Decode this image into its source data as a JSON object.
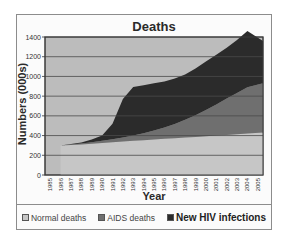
{
  "chart_data": {
    "type": "area",
    "stacked": true,
    "title": "Deaths",
    "xlabel": "Year",
    "ylabel": "Numbers (000s)",
    "ylim": [
      0,
      1400
    ],
    "yticks": [
      0,
      200,
      400,
      600,
      800,
      1000,
      1200,
      1400
    ],
    "grid": true,
    "legend_position": "bottom",
    "categories": [
      "1985",
      "1986",
      "1987",
      "1988",
      "1989",
      "1990",
      "1991",
      "1992",
      "1993",
      "1994",
      "1995",
      "1996",
      "1997",
      "1998",
      "1999",
      "2000",
      "2001",
      "2002",
      "2003",
      "2004",
      "2005"
    ],
    "series": [
      {
        "name": "Normal deaths",
        "color": "#c6c6c6",
        "values": [
          0,
          300,
          305,
          310,
          318,
          325,
          333,
          340,
          347,
          353,
          360,
          367,
          373,
          380,
          387,
          393,
          400,
          407,
          413,
          420,
          430
        ]
      },
      {
        "name": "AIDS deaths",
        "color": "#6f6f6f",
        "values": [
          0,
          0,
          5,
          10,
          15,
          22,
          30,
          40,
          55,
          70,
          90,
          115,
          145,
          180,
          220,
          265,
          315,
          370,
          420,
          470,
          500
        ]
      },
      {
        "name": "New HIV infections",
        "color": "#2b2b2b",
        "values": [
          0,
          0,
          5,
          10,
          27,
          53,
          157,
          390,
          490,
          487,
          480,
          468,
          462,
          460,
          473,
          492,
          505,
          513,
          537,
          570,
          430
        ]
      }
    ]
  },
  "title": "Deaths",
  "xlabel": "Year",
  "ylabel": "Numbers (000s)",
  "legend": {
    "normal": "Normal deaths",
    "aids": "AIDS deaths",
    "hiv": "New HIV infections"
  },
  "colors": {
    "plot_bg": "#bcbcbc",
    "normal": "#c6c6c6",
    "aids": "#6f6f6f",
    "hiv": "#2b2b2b",
    "grid": "#4a4a4a"
  }
}
